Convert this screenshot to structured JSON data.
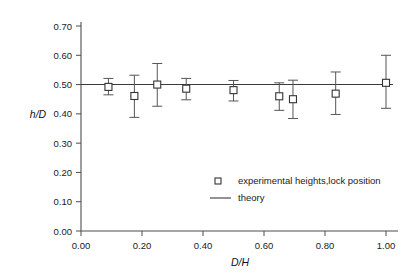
{
  "chart_data": {
    "type": "scatter",
    "title": "",
    "xlabel": "D/H",
    "ylabel": "h/D",
    "xlim": [
      0.0,
      1.0
    ],
    "ylim": [
      0.0,
      0.7
    ],
    "grid": false,
    "legend_position": "center-right",
    "xticks": [
      "0.00",
      "0.20",
      "0.40",
      "0.60",
      "0.80",
      "1.00"
    ],
    "xtick_values": [
      0.0,
      0.2,
      0.4,
      0.6,
      0.8,
      1.0
    ],
    "yticks": [
      "0.00",
      "0.10",
      "0.20",
      "0.30",
      "0.40",
      "0.50",
      "0.60",
      "0.70"
    ],
    "ytick_values": [
      0.0,
      0.1,
      0.2,
      0.3,
      0.4,
      0.5,
      0.6,
      0.7
    ],
    "series": [
      {
        "name": "experimental heights,lock position",
        "marker": "open-square",
        "x": [
          0.09,
          0.175,
          0.25,
          0.345,
          0.5,
          0.65,
          0.695,
          0.835,
          1.0
        ],
        "y": [
          0.492,
          0.461,
          0.5,
          0.486,
          0.481,
          0.46,
          0.45,
          0.469,
          0.506
        ],
        "yerr_low": [
          0.465,
          0.388,
          0.426,
          0.448,
          0.444,
          0.412,
          0.384,
          0.398,
          0.419
        ],
        "yerr_high": [
          0.521,
          0.532,
          0.572,
          0.521,
          0.514,
          0.506,
          0.515,
          0.543,
          0.6
        ]
      },
      {
        "name": "theory",
        "marker": "line",
        "value": 0.5
      }
    ],
    "legend": [
      {
        "label": "experimental heights,lock position",
        "symbol": "open-square"
      },
      {
        "label": "theory",
        "symbol": "line"
      }
    ]
  }
}
